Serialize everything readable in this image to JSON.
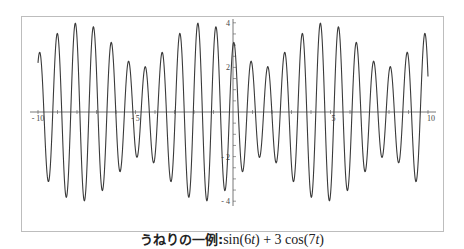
{
  "chart_data": {
    "type": "line",
    "caption_prefix": "うねりの一例:",
    "caption_formula": "sin(6t) + 3cos(7t)",
    "function": {
      "a": 1,
      "wa": 6,
      "b": 3,
      "wb": 7,
      "expr": "sin(6t) + 3cos(7t)"
    },
    "xlabel": "",
    "ylabel": "",
    "xlim": [
      -10,
      10
    ],
    "ylim": [
      -4,
      4
    ],
    "x_ticks": [
      -10,
      -5,
      5,
      10
    ],
    "y_ticks": [
      -4,
      -2,
      2,
      4
    ],
    "x_minor_step": 1,
    "y_minor_step": 0.5,
    "grid": false,
    "legend": null,
    "series": [
      {
        "name": "sin(6t) + 3cos(7t)",
        "x": [
          -10,
          -9,
          -8,
          -7,
          -6,
          -5,
          -4,
          -3,
          -2,
          -1,
          0,
          1,
          2,
          3,
          4,
          5,
          6,
          7,
          8,
          9,
          10
        ],
        "values": [
          2.204,
          3.516,
          3.326,
          1.818,
          -0.207,
          -1.723,
          -1.98,
          -0.893,
          0.948,
          2.541,
          3.0,
          1.983,
          -0.126,
          -2.395,
          -3.792,
          -3.699,
          -2.191,
          -0.016,
          1.79,
          2.398,
          1.594
        ]
      }
    ]
  },
  "style": {
    "line_color": "#3a3a3a",
    "axis_color": "#555555",
    "frame_color": "#bdbdbd",
    "tick_label_color": "#444444"
  }
}
